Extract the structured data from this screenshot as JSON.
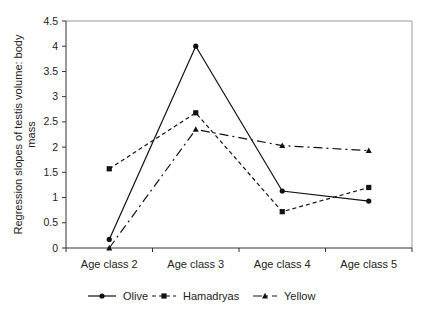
{
  "chart_data": {
    "type": "line",
    "title": "",
    "xlabel": "",
    "ylabel": "Regression slopes of testis volume: body mass",
    "ylabel_lines": [
      "Regression slopes of testis volume: body",
      "mass"
    ],
    "categories": [
      "Age class 2",
      "Age class 3",
      "Age class 4",
      "Age class 5"
    ],
    "ylim": [
      0,
      4.5
    ],
    "yticks": [
      "0",
      "0.5",
      "1",
      "1.5",
      "2",
      "2.5",
      "3",
      "3.5",
      "4",
      "4.5"
    ],
    "grid": false,
    "legend_position": "bottom",
    "series": [
      {
        "name": "Olive",
        "values": [
          0.17,
          4.0,
          1.13,
          0.93
        ],
        "marker": "circle",
        "dash": "solid"
      },
      {
        "name": "Hamadryas",
        "values": [
          1.57,
          2.68,
          0.72,
          1.2
        ],
        "marker": "square",
        "dash": "dashed"
      },
      {
        "name": "Yellow",
        "values": [
          0.0,
          2.35,
          2.03,
          1.93
        ],
        "marker": "triangle",
        "dash": "dashdot"
      }
    ]
  }
}
